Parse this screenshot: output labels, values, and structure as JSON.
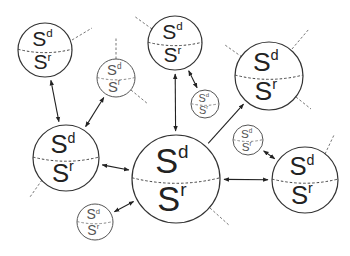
{
  "diagram": {
    "type": "network-of-spheres",
    "colors": {
      "background": "#ffffff",
      "stroke": "#333333",
      "dashed": "#777777"
    },
    "label_main": "S",
    "superscript_top": "d",
    "superscript_bottom": "r",
    "nodes": [
      {
        "id": "A",
        "cx": 45,
        "cy": 50,
        "r": 27,
        "size": "medium",
        "top_label": "S",
        "top_sup": "d",
        "bottom_label": "S",
        "bottom_sup": "r"
      },
      {
        "id": "B",
        "cx": 116,
        "cy": 78,
        "r": 19,
        "size": "small",
        "top_label": "S",
        "top_sup": "d",
        "bottom_label": "S",
        "bottom_sup": "r"
      },
      {
        "id": "C",
        "cx": 175,
        "cy": 43,
        "r": 27,
        "size": "medium",
        "top_label": "S",
        "top_sup": "d",
        "bottom_label": "S",
        "bottom_sup": "r"
      },
      {
        "id": "D",
        "cx": 205,
        "cy": 104,
        "r": 14,
        "size": "small",
        "top_label": "S",
        "top_sup": "d",
        "bottom_label": "S",
        "bottom_sup": "r"
      },
      {
        "id": "E",
        "cx": 269,
        "cy": 76,
        "r": 34,
        "size": "medium",
        "top_label": "S",
        "top_sup": "d",
        "bottom_label": "S",
        "bottom_sup": "r"
      },
      {
        "id": "F",
        "cx": 66,
        "cy": 158,
        "r": 33,
        "size": "medium",
        "top_label": "S",
        "top_sup": "d",
        "bottom_label": "S",
        "bottom_sup": "r"
      },
      {
        "id": "G",
        "cx": 176,
        "cy": 179,
        "r": 44,
        "size": "large",
        "top_label": "S",
        "top_sup": "d",
        "bottom_label": "S",
        "bottom_sup": "r"
      },
      {
        "id": "H",
        "cx": 248,
        "cy": 140,
        "r": 15,
        "size": "small",
        "top_label": "S",
        "top_sup": "d",
        "bottom_label": "S",
        "bottom_sup": "r"
      },
      {
        "id": "I",
        "cx": 305,
        "cy": 180,
        "r": 33,
        "size": "medium",
        "top_label": "S",
        "top_sup": "d",
        "bottom_label": "S",
        "bottom_sup": "r"
      },
      {
        "id": "J",
        "cx": 95,
        "cy": 222,
        "r": 18,
        "size": "small",
        "top_label": "S",
        "top_sup": "d",
        "bottom_label": "S",
        "bottom_sup": "r"
      }
    ],
    "edges": [
      {
        "from": "A",
        "to": "F",
        "bidirectional": true
      },
      {
        "from": "B",
        "to": "F",
        "bidirectional": true
      },
      {
        "from": "C",
        "to": "G",
        "bidirectional": true
      },
      {
        "from": "C",
        "to": "D",
        "bidirectional": true
      },
      {
        "from": "F",
        "to": "G",
        "bidirectional": true
      },
      {
        "from": "G",
        "to": "E",
        "bidirectional": false
      },
      {
        "from": "G",
        "to": "I",
        "bidirectional": true
      },
      {
        "from": "H",
        "to": "I",
        "bidirectional": true
      },
      {
        "from": "J",
        "to": "G",
        "bidirectional": true
      }
    ],
    "dangling_links": [
      {
        "node": "A",
        "x1": 72,
        "y1": 40,
        "x2": 92,
        "y2": 28
      },
      {
        "node": "B",
        "x1": 116,
        "y1": 59,
        "x2": 116,
        "y2": 38
      },
      {
        "node": "B",
        "x1": 131,
        "y1": 90,
        "x2": 148,
        "y2": 104
      },
      {
        "node": "C",
        "x1": 152,
        "y1": 29,
        "x2": 134,
        "y2": 16
      },
      {
        "node": "E",
        "x1": 242,
        "y1": 57,
        "x2": 225,
        "y2": 45
      },
      {
        "node": "E",
        "x1": 292,
        "y1": 49,
        "x2": 309,
        "y2": 29
      },
      {
        "node": "E",
        "x1": 296,
        "y1": 97,
        "x2": 311,
        "y2": 109
      },
      {
        "node": "F",
        "x1": 42,
        "y1": 180,
        "x2": 30,
        "y2": 197
      },
      {
        "node": "G",
        "x1": 210,
        "y1": 208,
        "x2": 230,
        "y2": 226
      },
      {
        "node": "I",
        "x1": 325,
        "y1": 154,
        "x2": 334,
        "y2": 135
      }
    ]
  }
}
